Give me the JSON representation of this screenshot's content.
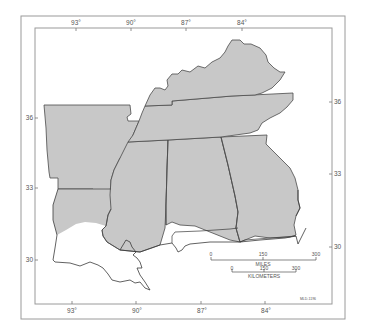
{
  "map": {
    "colors": {
      "background": "#ffffff",
      "frame": "#9a9a9a",
      "shaded_area": "#c8c8c8",
      "state_border": "#4a4a4a",
      "coastline": "#3a3a3a",
      "label": "#555555"
    },
    "longitude_labels_top": [
      "93°",
      "90°",
      "87°",
      "84°"
    ],
    "longitude_labels_bottom": [
      "93°",
      "90°",
      "87°",
      "84°"
    ],
    "latitude_labels_left": [
      "36",
      "33",
      "30"
    ],
    "latitude_labels_right": [
      "36",
      "33",
      "30"
    ],
    "scale_bar": {
      "miles": {
        "ticks": [
          "0",
          "150",
          "300"
        ],
        "unit_label": "MILES"
      },
      "kilometers": {
        "ticks": [
          "0",
          "150",
          "300"
        ],
        "unit_label": "KILOMETERS"
      }
    },
    "credit_code": "MLD-1196",
    "regions": [
      {
        "name": "Arkansas",
        "shaded": true
      },
      {
        "name": "Louisiana",
        "shaded": "northern part only"
      },
      {
        "name": "Mississippi",
        "shaded": "all but southern coast"
      },
      {
        "name": "Alabama",
        "shaded": "all but southern coast"
      },
      {
        "name": "Georgia",
        "shaded": "all but southern edge"
      },
      {
        "name": "Tennessee",
        "shaded": true
      },
      {
        "name": "Kentucky",
        "shaded": true
      },
      {
        "name": "Florida panhandle",
        "shaded": false
      }
    ]
  }
}
